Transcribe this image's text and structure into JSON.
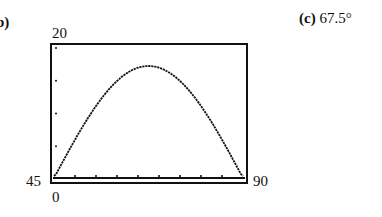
{
  "parts": {
    "b": {
      "label": "b)"
    },
    "c": {
      "label": "(c)",
      "value": "67.5°"
    }
  },
  "window": {
    "xmin_label": "45",
    "xmax_label": "90",
    "ymin_label": "0",
    "ymax_label": "20"
  },
  "chart_data": {
    "type": "line",
    "title": "",
    "xlabel": "",
    "ylabel": "",
    "xlim": [
      45,
      90
    ],
    "ylim": [
      0,
      20
    ],
    "x_tick_step": 5,
    "y_tick_step": 5,
    "grid": false,
    "legend": null,
    "series": [
      {
        "name": "range curve",
        "x": [
          45,
          50,
          55,
          60,
          65,
          67.5,
          70,
          75,
          80,
          85,
          90
        ],
        "y": [
          0.3,
          7.0,
          11.9,
          15.2,
          16.9,
          17.1,
          16.9,
          15.2,
          11.9,
          7.0,
          0.3
        ]
      }
    ],
    "annotations": [
      "Maximum at 67.5°"
    ]
  }
}
